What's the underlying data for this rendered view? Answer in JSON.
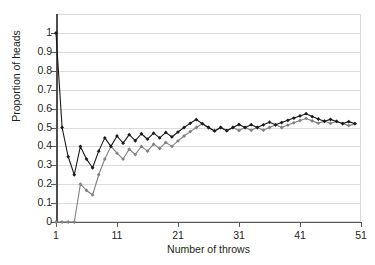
{
  "chart_data": {
    "type": "line",
    "title": "",
    "subtitle": "",
    "xlabel": "Number of throws",
    "ylabel": "Proportion of heads",
    "xlim": [
      1,
      51
    ],
    "ylim": [
      0,
      1
    ],
    "grid": true,
    "legend": "none",
    "xticks": [
      1,
      11,
      21,
      31,
      41,
      51
    ],
    "xtick_labels": [
      "1",
      "11",
      "21",
      "31",
      "41",
      "51"
    ],
    "yticks": [
      0,
      0.1,
      0.2,
      0.3,
      0.4,
      0.5,
      0.6,
      0.7,
      0.8,
      0.9,
      1
    ],
    "ytick_labels": [
      "0",
      "0.1",
      "0.2",
      "0.3",
      "0.4",
      "0.5",
      "0.6",
      "0.7",
      "0.8",
      "0.9",
      "1"
    ],
    "markers": "filled-diamond",
    "x": [
      1,
      2,
      3,
      4,
      5,
      6,
      7,
      8,
      9,
      10,
      11,
      12,
      13,
      14,
      15,
      16,
      17,
      18,
      19,
      20,
      21,
      22,
      23,
      24,
      25,
      26,
      27,
      28,
      29,
      30,
      31,
      32,
      33,
      34,
      35,
      36,
      37,
      38,
      39,
      40,
      41,
      42,
      43,
      44,
      45,
      46,
      47,
      48,
      49,
      50
    ],
    "series": [
      {
        "name": "Series 1",
        "color": "#1a1a1a",
        "values": [
          1.0,
          0.5,
          0.345,
          0.25,
          0.4,
          0.333,
          0.287,
          0.375,
          0.445,
          0.4,
          0.455,
          0.417,
          0.462,
          0.43,
          0.467,
          0.438,
          0.47,
          0.445,
          0.474,
          0.45,
          0.476,
          0.5,
          0.522,
          0.542,
          0.52,
          0.5,
          0.482,
          0.5,
          0.483,
          0.5,
          0.516,
          0.5,
          0.515,
          0.5,
          0.514,
          0.528,
          0.514,
          0.526,
          0.538,
          0.55,
          0.561,
          0.573,
          0.558,
          0.545,
          0.533,
          0.543,
          0.532,
          0.521,
          0.531,
          0.52
        ]
      },
      {
        "name": "Series 2",
        "color": "#808285",
        "values": [
          0.0,
          0.0,
          0.0,
          0.0,
          0.2,
          0.167,
          0.143,
          0.25,
          0.333,
          0.4,
          0.364,
          0.333,
          0.385,
          0.357,
          0.4,
          0.375,
          0.412,
          0.389,
          0.421,
          0.4,
          0.429,
          0.455,
          0.478,
          0.5,
          0.52,
          0.5,
          0.482,
          0.5,
          0.483,
          0.5,
          0.484,
          0.5,
          0.485,
          0.5,
          0.486,
          0.5,
          0.514,
          0.5,
          0.513,
          0.525,
          0.537,
          0.548,
          0.535,
          0.523,
          0.533,
          0.522,
          0.532,
          0.521,
          0.51,
          0.52
        ]
      }
    ]
  }
}
